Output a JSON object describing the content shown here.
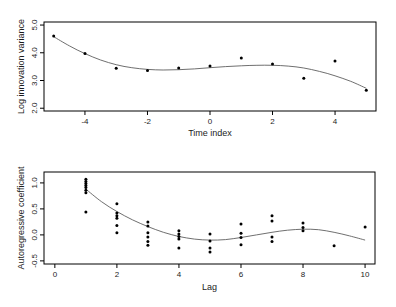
{
  "figure": {
    "background": "#ffffff",
    "panel_count": 2
  },
  "colors": {
    "point": "#000000",
    "curve": "#5f5f5f",
    "frame": "#000000",
    "text": "#1c1c1c"
  },
  "chart_data": [
    {
      "type": "scatter",
      "title": "",
      "xlabel": "Time index",
      "ylabel": "Log innovation variance",
      "xlim": [
        -5.31,
        5.31
      ],
      "ylim": [
        1.9,
        5.11
      ],
      "xticks": [
        -4,
        -2,
        0,
        2,
        4
      ],
      "xtick_labels": [
        "-4",
        "-2",
        "0",
        "2",
        "4"
      ],
      "yticks": [
        2.0,
        3.0,
        4.0,
        5.0
      ],
      "ytick_labels": [
        "2.0",
        "3.0",
        "4.0",
        "5.0"
      ],
      "grid": false,
      "legend": null,
      "points": [
        [
          -5,
          4.61
        ],
        [
          -4,
          3.97
        ],
        [
          -3,
          3.44
        ],
        [
          -2,
          3.36
        ],
        [
          -1,
          3.45
        ],
        [
          0,
          3.52
        ],
        [
          1,
          3.81
        ],
        [
          2,
          3.6
        ],
        [
          3,
          3.08
        ],
        [
          4,
          3.7
        ],
        [
          5,
          2.65
        ]
      ],
      "smooth_curve": [
        [
          -5,
          4.58
        ],
        [
          -4.5,
          4.25
        ],
        [
          -4,
          3.97
        ],
        [
          -3.5,
          3.74
        ],
        [
          -3,
          3.57
        ],
        [
          -2.5,
          3.46
        ],
        [
          -2,
          3.4
        ],
        [
          -1.5,
          3.38
        ],
        [
          -1,
          3.39
        ],
        [
          -0.5,
          3.42
        ],
        [
          0,
          3.46
        ],
        [
          0.5,
          3.5
        ],
        [
          1,
          3.53
        ],
        [
          1.5,
          3.55
        ],
        [
          2,
          3.55
        ],
        [
          2.5,
          3.52
        ],
        [
          3,
          3.45
        ],
        [
          3.5,
          3.33
        ],
        [
          4,
          3.17
        ],
        [
          4.5,
          2.97
        ],
        [
          5,
          2.72
        ]
      ]
    },
    {
      "type": "scatter",
      "title": "",
      "xlabel": "Lag",
      "ylabel": "Autoregressive coefficient",
      "xlim": [
        -0.35,
        10.32
      ],
      "ylim": [
        -0.56,
        1.21
      ],
      "xticks": [
        0,
        2,
        4,
        6,
        8,
        10
      ],
      "xtick_labels": [
        "0",
        "2",
        "4",
        "6",
        "8",
        "10"
      ],
      "yticks": [
        -0.5,
        0.0,
        0.5,
        1.0
      ],
      "ytick_labels": [
        "-0.5",
        "0.0",
        "0.5",
        "1.0"
      ],
      "grid": false,
      "legend": null,
      "points": [
        [
          1,
          1.07
        ],
        [
          1,
          1.03
        ],
        [
          1,
          0.99
        ],
        [
          1,
          0.95
        ],
        [
          1,
          0.91
        ],
        [
          1,
          0.86
        ],
        [
          1,
          0.81
        ],
        [
          1,
          0.44
        ],
        [
          2,
          0.6
        ],
        [
          2,
          0.42
        ],
        [
          2,
          0.37
        ],
        [
          2,
          0.32
        ],
        [
          2,
          0.18
        ],
        [
          2,
          0.04
        ],
        [
          3,
          0.25
        ],
        [
          3,
          0.17
        ],
        [
          3,
          0.04
        ],
        [
          3,
          -0.04
        ],
        [
          3,
          -0.13
        ],
        [
          3,
          -0.2
        ],
        [
          4,
          0.08
        ],
        [
          4,
          0.02
        ],
        [
          4,
          -0.03
        ],
        [
          4,
          -0.08
        ],
        [
          4,
          -0.25
        ],
        [
          5,
          0.02
        ],
        [
          5,
          -0.12
        ],
        [
          5,
          -0.25
        ],
        [
          5,
          -0.33
        ],
        [
          6,
          0.21
        ],
        [
          6,
          0.03
        ],
        [
          6,
          -0.05
        ],
        [
          6,
          -0.19
        ],
        [
          7,
          0.37
        ],
        [
          7,
          0.27
        ],
        [
          7,
          -0.04
        ],
        [
          7,
          -0.13
        ],
        [
          8,
          0.23
        ],
        [
          8,
          0.14
        ],
        [
          8,
          0.08
        ],
        [
          9,
          -0.21
        ],
        [
          10,
          0.15
        ]
      ],
      "smooth_curve": [
        [
          1,
          0.88
        ],
        [
          1.5,
          0.64
        ],
        [
          2,
          0.45
        ],
        [
          2.5,
          0.29
        ],
        [
          3,
          0.16
        ],
        [
          3.5,
          0.05
        ],
        [
          4,
          -0.03
        ],
        [
          4.5,
          -0.08
        ],
        [
          5,
          -0.1
        ],
        [
          5.5,
          -0.09
        ],
        [
          6,
          -0.05
        ],
        [
          6.5,
          0.0
        ],
        [
          7,
          0.05
        ],
        [
          7.5,
          0.09
        ],
        [
          8,
          0.11
        ],
        [
          8.5,
          0.1
        ],
        [
          9,
          0.05
        ],
        [
          9.5,
          -0.02
        ],
        [
          10,
          -0.1
        ]
      ]
    }
  ]
}
